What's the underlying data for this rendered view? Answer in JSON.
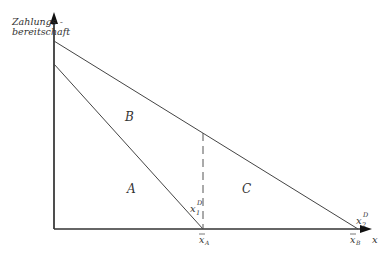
{
  "diagram": {
    "y_axis_label_line1": "Zahlungs -",
    "y_axis_label_line2": "bereitschaft",
    "x_axis_label": "x",
    "region_labels": {
      "A": "A",
      "B": "B",
      "C": "C"
    },
    "curve_labels": {
      "d1_main": "x",
      "d1_sub": "1",
      "d1_sup": "D",
      "d2_main": "x",
      "d2_sub": "2",
      "d2_sup": "D"
    },
    "tick_labels": {
      "xA_main": "x",
      "xA_sub": "A",
      "xB_main": "x",
      "xB_sub": "B"
    }
  }
}
